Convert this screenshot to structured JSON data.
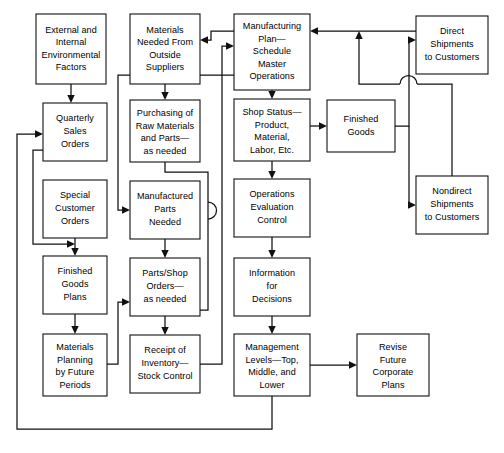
{
  "diagram": {
    "type": "flowchart",
    "background_color": "#ffffff",
    "line_color": "#111111",
    "box_fill": "#ffffff",
    "nodes": [
      {
        "id": "external-internal-environmental-factors",
        "lines": [
          "External and",
          "Internal",
          "Environmental",
          "Factors"
        ],
        "x": 36,
        "y": 14,
        "w": 70,
        "h": 70
      },
      {
        "id": "quarterly-sales-orders",
        "lines": [
          "Quarterly",
          "Sales",
          "Orders"
        ],
        "x": 43,
        "y": 103,
        "w": 64,
        "h": 58
      },
      {
        "id": "special-customer-orders",
        "lines": [
          "Special",
          "Customer",
          "Orders"
        ],
        "x": 43,
        "y": 180,
        "w": 64,
        "h": 58
      },
      {
        "id": "finished-goods-plans",
        "lines": [
          "Finished",
          "Goods",
          "Plans"
        ],
        "x": 43,
        "y": 256,
        "w": 64,
        "h": 58
      },
      {
        "id": "materials-planning-by-future-periods",
        "lines": [
          "Materials",
          "Planning",
          "by Future",
          "Periods"
        ],
        "x": 43,
        "y": 334,
        "w": 64,
        "h": 62
      },
      {
        "id": "materials-needed-from-outside-suppliers",
        "lines": [
          "Materials",
          "Needed From",
          "Outside",
          "Suppliers"
        ],
        "x": 130,
        "y": 14,
        "w": 70,
        "h": 70
      },
      {
        "id": "purchasing-of-raw-materials-and-parts",
        "lines": [
          "Purchasing of",
          "Raw Materials",
          "and Parts—",
          "as needed"
        ],
        "x": 130,
        "y": 100,
        "w": 70,
        "h": 62
      },
      {
        "id": "manufactured-parts-needed",
        "lines": [
          "Manufactured",
          "Parts",
          "Needed"
        ],
        "x": 130,
        "y": 181,
        "w": 70,
        "h": 58
      },
      {
        "id": "parts-shop-orders-as-needed",
        "lines": [
          "Parts/Shop",
          "Orders—",
          "as needed"
        ],
        "x": 130,
        "y": 258,
        "w": 70,
        "h": 58
      },
      {
        "id": "receipt-of-inventory-stock-control",
        "lines": [
          "Receipt of",
          "Inventory—",
          "Stock Control"
        ],
        "x": 130,
        "y": 335,
        "w": 70,
        "h": 58
      },
      {
        "id": "manufacturing-plan-schedule-master-operations",
        "lines": [
          "Manufacturing",
          "Plan—",
          "Schedule",
          "Master",
          "Operations"
        ],
        "x": 234,
        "y": 14,
        "w": 76,
        "h": 76
      },
      {
        "id": "shop-status-product-material-labor-etc",
        "lines": [
          "Shop Status—",
          "Product,",
          "Material,",
          "Labor, Etc."
        ],
        "x": 234,
        "y": 99,
        "w": 76,
        "h": 62
      },
      {
        "id": "operations-evaluation-control",
        "lines": [
          "Operations",
          "Evaluation",
          "Control"
        ],
        "x": 234,
        "y": 179,
        "w": 76,
        "h": 58
      },
      {
        "id": "information-for-decisions",
        "lines": [
          "Information",
          "for",
          "Decisions"
        ],
        "x": 234,
        "y": 258,
        "w": 76,
        "h": 58
      },
      {
        "id": "management-levels-top-middle-and-lower",
        "lines": [
          "Management",
          "Levels—Top,",
          "Middle, and",
          "Lower"
        ],
        "x": 234,
        "y": 334,
        "w": 76,
        "h": 62
      },
      {
        "id": "revise-future-corporate-plans",
        "lines": [
          "Revise",
          "Future",
          "Corporate",
          "Plans"
        ],
        "x": 357,
        "y": 334,
        "w": 72,
        "h": 62
      },
      {
        "id": "finished-goods",
        "lines": [
          "Finished",
          "Goods"
        ],
        "x": 327,
        "y": 100,
        "w": 68,
        "h": 52
      },
      {
        "id": "direct-shipments-to-customers",
        "lines": [
          "Direct",
          "Shipments",
          "to Customers"
        ],
        "x": 416,
        "y": 16,
        "w": 72,
        "h": 58
      },
      {
        "id": "nondirect-shipments-to-customers",
        "lines": [
          "Nondirect",
          "Shipments",
          "to Customers"
        ],
        "x": 416,
        "y": 176,
        "w": 72,
        "h": 58
      }
    ],
    "connectors": [
      {
        "id": "env-factors-to-quarterly-sales-orders",
        "from": "external-internal-environmental-factors",
        "to": "quarterly-sales-orders"
      },
      {
        "id": "quarterly-sales-orders-to-finished-goods-plans",
        "from": "quarterly-sales-orders",
        "to": "finished-goods-plans"
      },
      {
        "id": "special-customer-orders-to-finished-goods-plans",
        "from": "special-customer-orders",
        "to": "finished-goods-plans"
      },
      {
        "id": "finished-goods-plans-to-materials-planning",
        "from": "finished-goods-plans",
        "to": "materials-planning-by-future-periods"
      },
      {
        "id": "materials-planning-to-manufacturing-feedback",
        "from": "materials-planning-by-future-periods",
        "to": "parts-shop-orders-as-needed"
      },
      {
        "id": "materials-needed-to-purchasing",
        "from": "materials-needed-from-outside-suppliers",
        "to": "purchasing-of-raw-materials-and-parts"
      },
      {
        "id": "purchasing-to-receipt-of-inventory",
        "from": "purchasing-of-raw-materials-and-parts",
        "to": "receipt-of-inventory-stock-control"
      },
      {
        "id": "manufactured-parts-to-parts-shop-orders",
        "from": "manufactured-parts-needed",
        "to": "parts-shop-orders-as-needed"
      },
      {
        "id": "parts-shop-orders-to-receipt-of-inventory",
        "from": "parts-shop-orders-as-needed",
        "to": "receipt-of-inventory-stock-control"
      },
      {
        "id": "manufacturing-plan-to-shop-status",
        "from": "manufacturing-plan-schedule-master-operations",
        "to": "shop-status-product-material-labor-etc"
      },
      {
        "id": "shop-status-to-operations-evaluation",
        "from": "shop-status-product-material-labor-etc",
        "to": "operations-evaluation-control"
      },
      {
        "id": "shop-status-to-finished-goods",
        "from": "shop-status-product-material-labor-etc",
        "to": "finished-goods"
      },
      {
        "id": "operations-evaluation-to-information",
        "from": "operations-evaluation-control",
        "to": "information-for-decisions"
      },
      {
        "id": "information-to-management-levels",
        "from": "information-for-decisions",
        "to": "management-levels-top-middle-and-lower"
      },
      {
        "id": "management-levels-to-revise-plans",
        "from": "management-levels-top-middle-and-lower",
        "to": "revise-future-corporate-plans"
      },
      {
        "id": "management-levels-to-quarterly-sales-feedback",
        "from": "management-levels-top-middle-and-lower",
        "to": "quarterly-sales-orders"
      },
      {
        "id": "manufacturing-plan-to-materials-needed",
        "from": "manufacturing-plan-schedule-master-operations",
        "to": "materials-needed-from-outside-suppliers"
      },
      {
        "id": "manufacturing-plan-to-manufactured-parts",
        "from": "manufacturing-plan-schedule-master-operations",
        "to": "manufactured-parts-needed"
      },
      {
        "id": "receipt-of-inventory-to-manufacturing-plan",
        "from": "receipt-of-inventory-stock-control",
        "to": "manufacturing-plan-schedule-master-operations"
      },
      {
        "id": "finished-goods-to-direct-shipments",
        "from": "finished-goods",
        "to": "direct-shipments-to-customers"
      },
      {
        "id": "finished-goods-to-nondirect-shipments",
        "from": "finished-goods",
        "to": "nondirect-shipments-to-customers"
      },
      {
        "id": "direct-shipments-to-manufacturing-plan",
        "from": "direct-shipments-to-customers",
        "to": "manufacturing-plan-schedule-master-operations"
      },
      {
        "id": "nondirect-shipments-to-manufacturing-plan",
        "from": "nondirect-shipments-to-customers",
        "to": "manufacturing-plan-schedule-master-operations"
      }
    ]
  }
}
